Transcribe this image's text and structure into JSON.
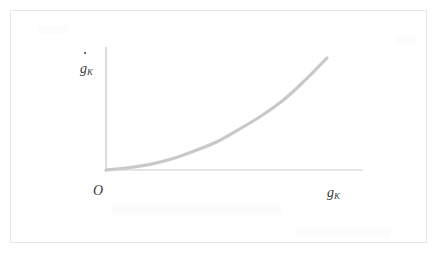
{
  "figure": {
    "title": "",
    "background_color": "#ffffff",
    "frame_color": "#e9e9e9",
    "axis_color": "#dcdcdc",
    "curve_color": "#c9c9c9",
    "label_color": "#3b3b3b"
  },
  "labels": {
    "origin": "O",
    "y_axis_base": "g",
    "y_axis_subscript": "K",
    "y_axis_accent": "dot",
    "x_axis_base": "g",
    "x_axis_subscript": "K"
  },
  "chart_data": {
    "type": "line",
    "title": "",
    "xlabel": "g_K",
    "ylabel": "g_K-dot",
    "grid": false,
    "legend": null,
    "xlim": [
      0,
      1
    ],
    "ylim": [
      0,
      1
    ],
    "axis_ticks": {
      "x": [],
      "y": []
    },
    "annotations": [
      {
        "text": "O",
        "x": 0,
        "y": 0,
        "position": "below-left-of-origin"
      },
      {
        "text": "g_K-dot",
        "x": 0,
        "y": 1,
        "position": "left-of-y-axis-top"
      },
      {
        "text": "g_K",
        "x": 1,
        "y": 0,
        "position": "right-of-x-axis-end"
      }
    ],
    "series": [
      {
        "name": "g_K-dot as a function of g_K",
        "shape": "convex-increasing",
        "x": [
          0.0,
          0.1,
          0.2,
          0.3,
          0.4,
          0.5,
          0.6,
          0.7,
          0.8,
          0.9,
          1.0
        ],
        "y": [
          0.0,
          0.02,
          0.05,
          0.1,
          0.17,
          0.25,
          0.36,
          0.48,
          0.62,
          0.8,
          1.0
        ]
      }
    ]
  }
}
